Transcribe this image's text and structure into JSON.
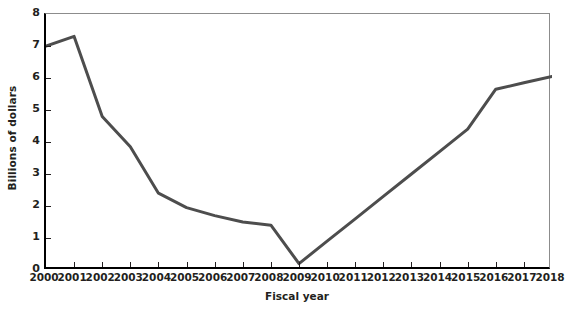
{
  "chart_data": {
    "type": "line",
    "title": "",
    "xlabel": "Fiscal year",
    "ylabel": "Billions of dollars",
    "x": [
      2000,
      2001,
      2002,
      2003,
      2004,
      2005,
      2006,
      2007,
      2008,
      2009,
      2010,
      2011,
      2012,
      2013,
      2014,
      2015,
      2016,
      2017,
      2018
    ],
    "categories": [
      "2000",
      "2001",
      "2002",
      "2003",
      "2004",
      "2005",
      "2006",
      "2007",
      "2008",
      "2009",
      "2010",
      "2011",
      "2012",
      "2013",
      "2014",
      "2015",
      "2016",
      "2017",
      "2018"
    ],
    "values": [
      7.0,
      7.3,
      4.8,
      3.85,
      2.4,
      1.95,
      1.7,
      1.5,
      1.4,
      0.2,
      0.9,
      1.6,
      2.3,
      3.0,
      3.7,
      4.4,
      5.65,
      5.85,
      6.05
    ],
    "series": [
      {
        "name": "Billions of dollars",
        "values": [
          7.0,
          7.3,
          4.8,
          3.85,
          2.4,
          1.95,
          1.7,
          1.5,
          1.4,
          0.2,
          0.9,
          1.6,
          2.3,
          3.0,
          3.7,
          4.4,
          5.65,
          5.85,
          6.05
        ]
      }
    ],
    "xlim": [
      2000,
      2018
    ],
    "ylim": [
      0,
      8
    ],
    "yticks": [
      0,
      1,
      2,
      3,
      4,
      5,
      6,
      7,
      8
    ],
    "ytick_labels": [
      "0",
      "1",
      "2",
      "3",
      "4",
      "5",
      "6",
      "7",
      "8"
    ],
    "grid": false,
    "legend": false,
    "legend_position": "none",
    "line_color": "#4d4d4d",
    "axis_color": "#000000",
    "frame_color": "#8c8c8c",
    "background": "#ffffff"
  }
}
